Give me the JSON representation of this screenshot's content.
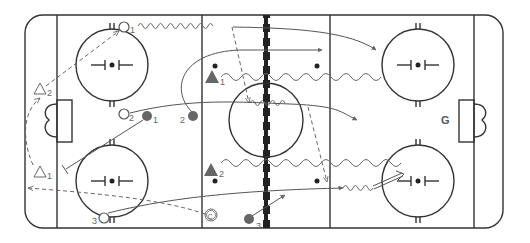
{
  "diagram": {
    "type": "hockey-rink-drill",
    "colors": {
      "line": "#333333",
      "path": "#666666",
      "player_fill": "#666666",
      "background": "#ffffff"
    },
    "players": {
      "offense_circles": [
        {
          "id": "O1",
          "label": "1",
          "x": 124,
          "y": 27
        },
        {
          "id": "O2",
          "label": "2",
          "x": 124,
          "y": 114
        },
        {
          "id": "O3",
          "label": "3",
          "x": 104,
          "y": 218
        }
      ],
      "defense_dots": [
        {
          "id": "D1",
          "label": "1",
          "x": 147,
          "y": 116
        },
        {
          "id": "D2",
          "label": "2",
          "x": 193,
          "y": 116
        },
        {
          "id": "D3",
          "label": "3",
          "x": 249,
          "y": 219
        }
      ],
      "attack_triangles_filled": [
        {
          "id": "T1",
          "label": "1",
          "x": 212,
          "y": 77
        },
        {
          "id": "T2",
          "label": "2",
          "x": 211,
          "y": 170
        }
      ],
      "outline_triangles": [
        {
          "id": "A1",
          "label": "1",
          "x": 40,
          "y": 171
        },
        {
          "id": "A2",
          "label": "2",
          "x": 40,
          "y": 91
        }
      ],
      "coach": {
        "label": "C",
        "x": 211,
        "y": 215
      },
      "goalie": {
        "label": "G",
        "x": 446,
        "y": 119
      }
    }
  }
}
